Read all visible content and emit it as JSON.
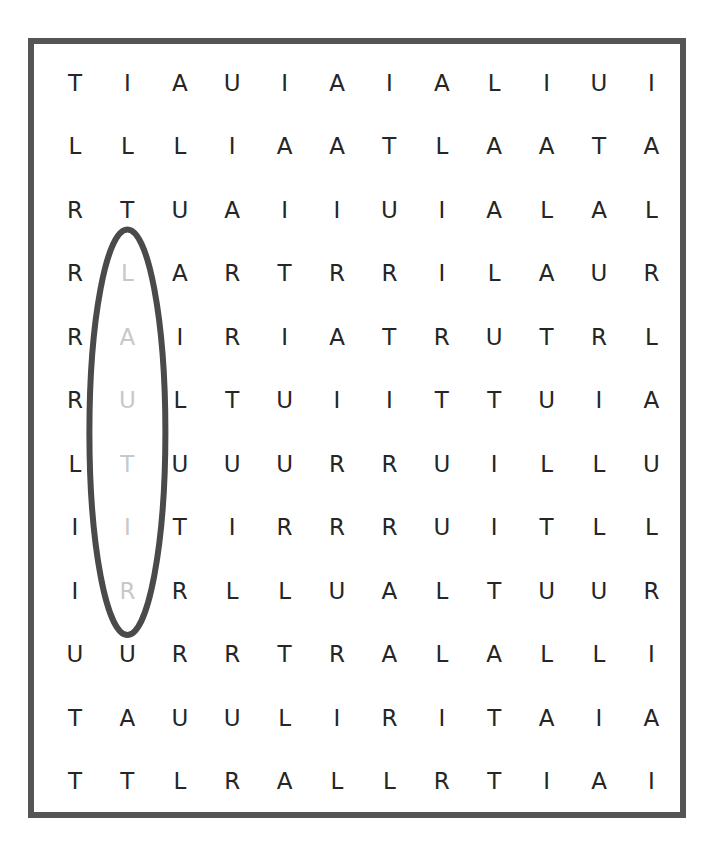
{
  "puzzle": {
    "type": "word-search",
    "rows": 12,
    "cols": 12,
    "grid": [
      [
        "T",
        "I",
        "A",
        "U",
        "I",
        "A",
        "I",
        "A",
        "L",
        "I",
        "U",
        "I"
      ],
      [
        "L",
        "L",
        "L",
        "I",
        "A",
        "A",
        "T",
        "L",
        "A",
        "A",
        "T",
        "A"
      ],
      [
        "R",
        "T",
        "U",
        "A",
        "I",
        "I",
        "U",
        "I",
        "A",
        "L",
        "A",
        "L"
      ],
      [
        "R",
        "L",
        "A",
        "R",
        "T",
        "R",
        "R",
        "I",
        "L",
        "A",
        "U",
        "R"
      ],
      [
        "R",
        "A",
        "I",
        "R",
        "I",
        "A",
        "T",
        "R",
        "U",
        "T",
        "R",
        "L"
      ],
      [
        "R",
        "U",
        "L",
        "T",
        "U",
        "I",
        "I",
        "T",
        "T",
        "U",
        "I",
        "A"
      ],
      [
        "L",
        "T",
        "U",
        "U",
        "U",
        "R",
        "R",
        "U",
        "I",
        "L",
        "L",
        "U"
      ],
      [
        "I",
        "I",
        "T",
        "I",
        "R",
        "R",
        "R",
        "U",
        "I",
        "T",
        "L",
        "L"
      ],
      [
        "I",
        "R",
        "R",
        "L",
        "L",
        "U",
        "A",
        "L",
        "T",
        "U",
        "U",
        "R"
      ],
      [
        "U",
        "U",
        "R",
        "R",
        "T",
        "R",
        "A",
        "L",
        "A",
        "L",
        "L",
        "I"
      ],
      [
        "T",
        "A",
        "U",
        "U",
        "L",
        "I",
        "R",
        "I",
        "T",
        "A",
        "I",
        "A"
      ],
      [
        "T",
        "T",
        "L",
        "R",
        "A",
        "L",
        "L",
        "R",
        "T",
        "I",
        "A",
        "I"
      ]
    ],
    "found_words": [
      {
        "word": "RITUAL",
        "direction": "up",
        "cells": [
          [
            8,
            1
          ],
          [
            7,
            1
          ],
          [
            6,
            1
          ],
          [
            5,
            1
          ],
          [
            4,
            1
          ],
          [
            3,
            1
          ]
        ]
      }
    ],
    "colors": {
      "letter": "#262626",
      "found_letter": "#c8c8c8",
      "frame": "#555555",
      "highlight": "#4a4a4a"
    }
  }
}
